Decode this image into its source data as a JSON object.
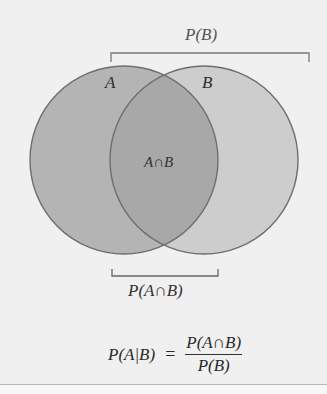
{
  "diagram": {
    "type": "venn",
    "sets": [
      {
        "id": "A",
        "label": "A",
        "cx": 124,
        "cy": 160,
        "r": 94,
        "fill": "#b4b4b4"
      },
      {
        "id": "B",
        "label": "B",
        "cx": 204,
        "cy": 160,
        "r": 94,
        "fill": "#cdcdcd"
      }
    ],
    "intersection_label": "A∩B",
    "intersection_fill": "#a8a8a8",
    "stroke_color": "#6e6e6e",
    "background": "#f0f0f0"
  },
  "brackets": {
    "p_b": {
      "label": "P(B)",
      "x1": 111,
      "x2": 309,
      "y": 53,
      "tick": 9
    },
    "p_a_and_b": {
      "label": "P(A∩B)",
      "x1": 112,
      "x2": 218,
      "y": 276,
      "tick": -7
    }
  },
  "formula": {
    "lhs": "P(A|B)",
    "equals": "=",
    "numerator": "P(A∩B)",
    "denominator": "P(B)"
  }
}
